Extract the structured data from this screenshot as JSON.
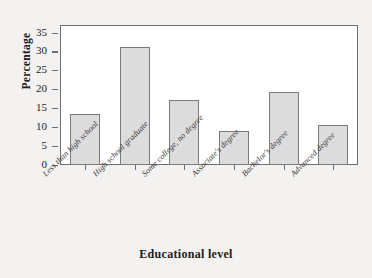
{
  "chart_data": {
    "type": "bar",
    "title": "",
    "xlabel": "Educational level",
    "ylabel": "Percentage",
    "categories": [
      "Less than high school",
      "High school graduate",
      "Some college, no degree",
      "Associate's degree",
      "Bachelor's degree",
      "Advanced degree"
    ],
    "values": [
      13.4,
      31.2,
      17.1,
      9.0,
      19.3,
      10.5
    ],
    "ylim": [
      0,
      37
    ],
    "yticks": [
      0,
      5,
      10,
      15,
      20,
      25,
      30,
      35
    ],
    "ytick_labels": [
      "0",
      "5",
      "10",
      "15",
      "20",
      "25",
      "30",
      "35"
    ],
    "grid": false,
    "legend": null,
    "bar_fill_color": "#dcdcdc",
    "bar_edge_color": "#7a7a7a",
    "axis_color": "#6e6e6e",
    "plot_background": "#ffffff",
    "figure_background": "#f3f2f0"
  }
}
